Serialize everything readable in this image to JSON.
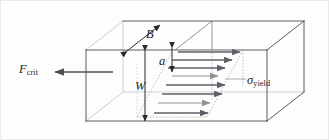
{
  "figure": {
    "kind": "engineering-diagram",
    "background_color": "#fdfdfd",
    "frame_color": "#e9e9e9"
  },
  "labels": {
    "force": {
      "symbol": "F",
      "subscript": "crit",
      "name": "critical force"
    },
    "stress": {
      "symbol": "σ",
      "subscript": "yield",
      "name": "yield stress"
    },
    "thickness": {
      "symbol": "B",
      "name": "thickness"
    },
    "crack_length": {
      "symbol": "a",
      "name": "crack length"
    },
    "width": {
      "symbol": "W",
      "name": "width"
    }
  },
  "geometry": {
    "box": {
      "front_left_x": 86,
      "front_right_x": 267,
      "front_top_y": 50,
      "front_bottom_y": 121,
      "depth_dx": 37,
      "depth_dy": -29
    },
    "crack_plane_y": 50,
    "interior_edge_x": 205,
    "mid_partition_x": 175
  },
  "colors": {
    "edge_line": "#4a4a4a",
    "hidden_line": "#9a9a9a",
    "dotted_line": "#a8a8a8",
    "arrow_dark": "#5e6068",
    "arrow_light": "#8f9199",
    "dimension_line": "#2a2a2a",
    "force_arrow": "#4e5058",
    "text": "#1c1c1c"
  },
  "stress_arrows": {
    "count": 8,
    "description": "Horizontal arrows of varying length forming the yield-stress profile on the sheared crack-plane parallelogram",
    "rows": [
      {
        "index": 0,
        "y": 52,
        "x_start": 178,
        "x_end": 240,
        "tone": "dark"
      },
      {
        "index": 1,
        "y": 60,
        "x_start": 172,
        "x_end": 232,
        "tone": "dark"
      },
      {
        "index": 2,
        "y": 68,
        "x_start": 168,
        "x_end": 225,
        "tone": "dark"
      },
      {
        "index": 3,
        "y": 76,
        "x_start": 172,
        "x_end": 218,
        "tone": "light"
      },
      {
        "index": 4,
        "y": 85,
        "x_start": 166,
        "x_end": 225,
        "tone": "dark"
      },
      {
        "index": 5,
        "y": 94,
        "x_start": 162,
        "x_end": 222,
        "tone": "dark"
      },
      {
        "index": 6,
        "y": 103,
        "x_start": 158,
        "x_end": 210,
        "tone": "light"
      },
      {
        "index": 7,
        "y": 113,
        "x_start": 154,
        "x_end": 208,
        "tone": "dark"
      }
    ]
  }
}
